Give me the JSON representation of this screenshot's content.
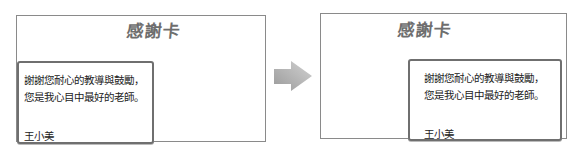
{
  "before": {
    "title": "感謝卡",
    "message_lines": [
      "謝謝您耐心的教導與鼓勵，",
      "您是我心目中最好的老師。"
    ],
    "signature": "王小美",
    "layout": "message box aligned left"
  },
  "after": {
    "title": "感謝卡",
    "message_lines": [
      "謝謝您耐心的教導與鼓勵，",
      "您是我心目中最好的老師。"
    ],
    "signature": "王小美",
    "layout": "message box aligned right"
  },
  "transition": {
    "icon": "right-arrow-icon"
  },
  "colors": {
    "border": "#8a8a8a",
    "box_border": "#6f6f6f",
    "title": "#6e6e6e",
    "arrow": "#a8a8a8"
  }
}
